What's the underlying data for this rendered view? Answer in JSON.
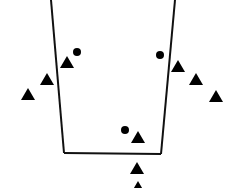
{
  "diagram": {
    "colors": {
      "stroke": "#111111",
      "marker": "#000000",
      "background": "#ffffff"
    },
    "shape": {
      "type": "open-trapezoid",
      "sides": [
        "left",
        "bottom",
        "right"
      ]
    },
    "markers": {
      "dots": [
        {
          "id": "dot-upper-left"
        },
        {
          "id": "dot-upper-right"
        },
        {
          "id": "dot-bottom"
        }
      ],
      "triangles": [
        {
          "id": "triangle-left-1"
        },
        {
          "id": "triangle-left-2"
        },
        {
          "id": "triangle-left-3"
        },
        {
          "id": "triangle-right-1"
        },
        {
          "id": "triangle-right-2"
        },
        {
          "id": "triangle-right-3"
        },
        {
          "id": "triangle-bottom-inside"
        },
        {
          "id": "triangle-bottom-below-1"
        },
        {
          "id": "triangle-bottom-below-2"
        }
      ]
    }
  }
}
